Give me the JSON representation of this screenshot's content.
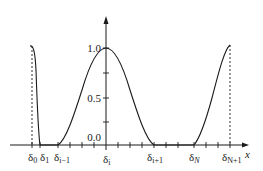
{
  "diagram": {
    "title": "",
    "colors": {
      "line": "#1a1a1a",
      "background": "#ffffff"
    },
    "x_axis": {
      "label": "x",
      "tick_labels": [
        {
          "base": "δ",
          "sub": "0",
          "x": 32
        },
        {
          "base": "δ",
          "sub": "1",
          "x": 44
        },
        {
          "base": "δ",
          "sub": "i−1",
          "x": 62
        },
        {
          "base": "δ",
          "sub": "i",
          "x": 106
        },
        {
          "base": "δ",
          "sub": "i+1",
          "x": 156
        },
        {
          "base": "δ",
          "sub": "N",
          "x": 196
        },
        {
          "base": "δ",
          "sub": "N+1",
          "x": 232
        }
      ]
    },
    "y_axis": {
      "tick_labels": [
        "1.0",
        "0.5",
        "0.0"
      ]
    },
    "curves": [
      {
        "name": "left-boundary-basis",
        "peak_x": "δ0",
        "peak_value": 1.0,
        "support": [
          "δ0",
          "δ1"
        ]
      },
      {
        "name": "central-basis-function",
        "peak_x": "δi",
        "peak_value": 1.0,
        "support": [
          "δi−1",
          "δi+1"
        ]
      },
      {
        "name": "right-boundary-basis",
        "peak_x": "δN+1",
        "peak_value": 1.0,
        "support": [
          "δN",
          "δN+1"
        ]
      }
    ]
  }
}
